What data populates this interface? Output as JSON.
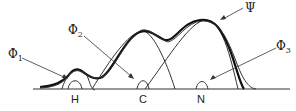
{
  "labels": {
    "phi1": {
      "base": "Φ",
      "sub": "1"
    },
    "phi2": {
      "base": "Φ",
      "sub": "2"
    },
    "phi3": {
      "base": "Φ",
      "sub": "3"
    },
    "psi": "Ψ"
  },
  "atoms": [
    "H",
    "C",
    "N"
  ],
  "colors": {
    "line": "#222222",
    "background": "#ffffff"
  }
}
